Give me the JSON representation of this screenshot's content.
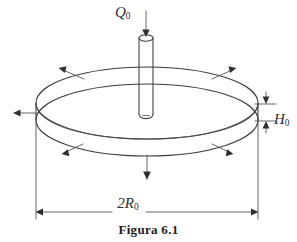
{
  "figure": {
    "caption": "Figura 6.1",
    "background_color": "#ffffff",
    "line_color": "#3c3c42"
  },
  "labels": {
    "heat_source": {
      "symbol": "Q",
      "subscript": "0",
      "name": "Q-zero"
    },
    "thickness": {
      "symbol": "H",
      "subscript": "0",
      "name": "H-zero"
    },
    "diameter": {
      "prefix": "2",
      "symbol": "R",
      "subscript": "0",
      "name": "2R-zero"
    }
  },
  "geometry": {
    "disk": {
      "center_x": 147,
      "top_ellipse_cy": 103,
      "bottom_ellipse_cy": 120,
      "radius_x": 111,
      "radius_y": 36,
      "thickness_px": 17
    },
    "cylinder": {
      "center_x": 146,
      "top_y": 37,
      "bottom_y": 116,
      "half_width": 7,
      "rim_ry": 3.2
    }
  },
  "arrows": {
    "inflow": {
      "name": "heat-inflow-arrow",
      "direction": "down",
      "count": 1
    },
    "outflow_top": {
      "name": "top-surface-flux-arrows",
      "direction": "outward-up",
      "count": 2
    },
    "outflow_side": {
      "name": "side-flux-arrow",
      "direction": "left",
      "count": 1
    },
    "outflow_bottom": {
      "name": "bottom-surface-flux-arrows",
      "direction": "outward-down",
      "count": 2
    },
    "outflow_down": {
      "name": "bottom-center-flux-arrow",
      "direction": "down",
      "count": 1
    }
  },
  "dimensions": {
    "width_line": {
      "y": 212,
      "x_start": 35,
      "x_end": 258
    },
    "thickness_line": {
      "x": 266,
      "y_top": 104,
      "y_bottom": 121
    }
  }
}
